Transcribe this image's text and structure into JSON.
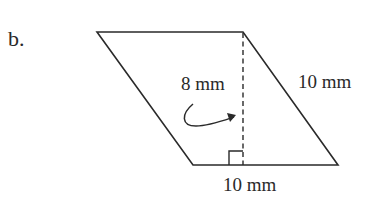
{
  "problem": {
    "label": "b."
  },
  "figure": {
    "shape": "parallelogram",
    "height_label": "8 mm",
    "side_label": "10 mm",
    "base_label": "10 mm",
    "stroke_color": "#2a2a2a"
  }
}
